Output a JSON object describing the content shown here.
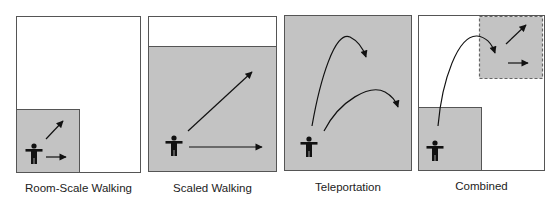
{
  "figure": {
    "colors": {
      "tracked_area": "#c3c3c3",
      "border": "#555555",
      "arrow": "#111111",
      "background": "#ffffff"
    },
    "panels": [
      {
        "id": "room-scale",
        "caption": "Room-Scale Walking"
      },
      {
        "id": "scaled",
        "caption": "Scaled Walking"
      },
      {
        "id": "teleportation",
        "caption": "Teleportation"
      },
      {
        "id": "combined",
        "caption": "Combined"
      }
    ]
  }
}
